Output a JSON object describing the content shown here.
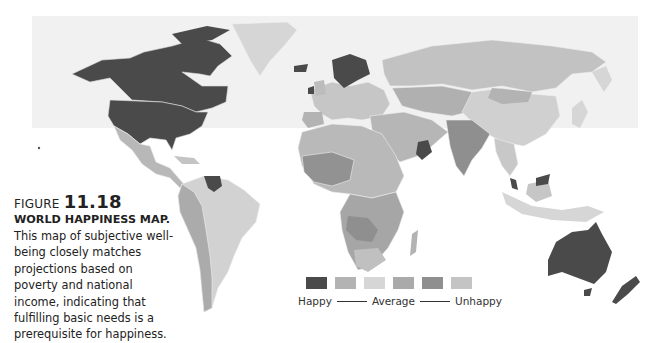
{
  "figure": {
    "label": "FIGURE",
    "number": "11.18",
    "title": "WORLD HAPPINESS MAP.",
    "body": "This map of subjective well-being closely matches projections based on poverty and national income, indicating that fulfilling basic needs is a prerequisite for happiness."
  },
  "legend": {
    "swatches": [
      {
        "level": 1,
        "color": "#4a4a4a"
      },
      {
        "level": 2,
        "color": "#b3b3b3"
      },
      {
        "level": 3,
        "color": "#d6d6d6"
      },
      {
        "level": 4,
        "color": "#aaaaaa"
      },
      {
        "level": 5,
        "color": "#8f8f8f"
      },
      {
        "level": 6,
        "color": "#c4c4c4"
      }
    ],
    "labels": {
      "left": "Happy",
      "middle": "Average",
      "right": "Unhappy"
    }
  },
  "colors": {
    "happy": "#4a4a4a",
    "light": "#d6d6d6",
    "mid": "#b3b3b3",
    "dark_mid": "#8f8f8f",
    "border": "#e8e8e8"
  }
}
